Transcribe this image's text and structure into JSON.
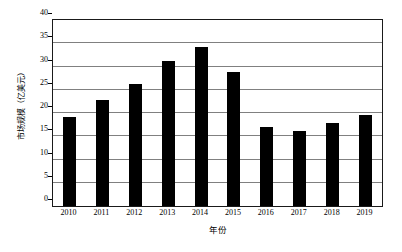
{
  "chart_data": {
    "type": "bar",
    "title": "",
    "xlabel": "年份",
    "ylabel": "市场规模（亿美元）",
    "categories": [
      "2010",
      "2011",
      "2012",
      "2013",
      "2014",
      "2015",
      "2016",
      "2017",
      "2018",
      "2019"
    ],
    "values": [
      19.1,
      22.9,
      26.3,
      31.2,
      34.3,
      28.8,
      17.0,
      16.2,
      17.8,
      19.6
    ],
    "ylim": [
      0,
      40
    ],
    "ytick_step": 5,
    "yticks": [
      "0",
      "5",
      "10",
      "15",
      "20",
      "25",
      "30",
      "35",
      "40"
    ],
    "grid": "horizontal",
    "legend": "none",
    "bar_color": "#000000",
    "gridline_color": "#808080",
    "frame_color": "#1a1a1a",
    "background_color": "#ffffff"
  }
}
